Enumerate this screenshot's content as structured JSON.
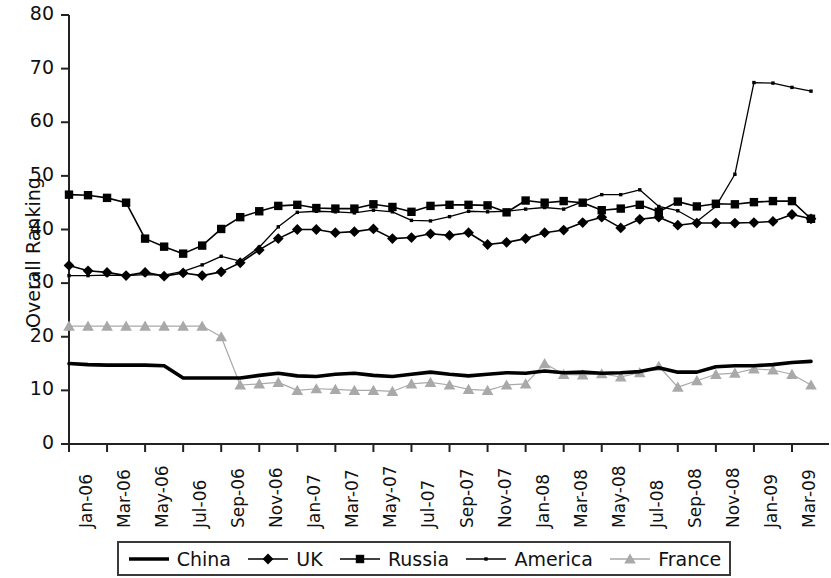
{
  "chart_data": {
    "type": "line",
    "title": "",
    "xlabel": "",
    "ylabel": "Overall Ranking",
    "ylim": [
      0,
      80
    ],
    "ytick_step": 10,
    "yticks": [
      0,
      10,
      20,
      30,
      40,
      50,
      60,
      70,
      80
    ],
    "grid": false,
    "legend_position": "bottom",
    "x": [
      "Jan-06",
      "Feb-06",
      "Mar-06",
      "Apr-06",
      "May-06",
      "Jun-06",
      "Jul-06",
      "Aug-06",
      "Sep-06",
      "Oct-06",
      "Nov-06",
      "Dec-06",
      "Jan-07",
      "Feb-07",
      "Mar-07",
      "Apr-07",
      "May-07",
      "Jun-07",
      "Jul-07",
      "Aug-07",
      "Sep-07",
      "Oct-07",
      "Nov-07",
      "Dec-07",
      "Jan-08",
      "Feb-08",
      "Mar-08",
      "Apr-08",
      "May-08",
      "Jun-08",
      "Jul-08",
      "Aug-08",
      "Sep-08",
      "Oct-08",
      "Nov-08",
      "Dec-08",
      "Jan-09",
      "Feb-09",
      "Mar-09",
      "Apr-09"
    ],
    "xtick_labels": [
      "Jan-06",
      "Mar-06",
      "May-06",
      "Jul-06",
      "Sep-06",
      "Nov-06",
      "Jan-07",
      "Mar-07",
      "May-07",
      "Jul-07",
      "Sep-07",
      "Nov-07",
      "Jan-08",
      "Mar-08",
      "May-08",
      "Jul-08",
      "Sep-08",
      "Nov-08",
      "Jan-09",
      "Mar-09"
    ],
    "xtick_every": 2,
    "series": [
      {
        "name": "China",
        "color": "#000000",
        "marker": "none",
        "line_width": 3.6,
        "values": [
          15.0,
          14.8,
          14.7,
          14.7,
          14.7,
          14.6,
          12.3,
          12.3,
          12.3,
          12.3,
          12.8,
          13.2,
          12.7,
          12.6,
          13.0,
          13.2,
          12.8,
          12.6,
          13.0,
          13.4,
          13.0,
          12.7,
          13.0,
          13.3,
          13.2,
          13.6,
          13.3,
          13.4,
          13.2,
          13.3,
          13.5,
          14.2,
          13.4,
          13.4,
          14.4,
          14.6,
          14.6,
          14.8,
          15.2,
          15.4
        ]
      },
      {
        "name": "UK",
        "color": "#000000",
        "marker": "diamond",
        "line_width": 1.6,
        "values": [
          33.3,
          32.3,
          32.0,
          31.4,
          32.0,
          31.3,
          31.9,
          31.4,
          32.1,
          33.8,
          36.2,
          38.3,
          40.0,
          40.0,
          39.4,
          39.6,
          40.1,
          38.3,
          38.5,
          39.2,
          38.9,
          39.4,
          37.2,
          37.6,
          38.3,
          39.4,
          39.9,
          41.3,
          42.3,
          40.3,
          41.9,
          42.3,
          40.8,
          41.2,
          41.2,
          41.2,
          41.3,
          41.5,
          42.8,
          42.0
        ]
      },
      {
        "name": "Russia",
        "color": "#000000",
        "marker": "square",
        "line_width": 1.6,
        "values": [
          46.5,
          46.4,
          45.9,
          45.0,
          38.3,
          36.8,
          35.5,
          37.0,
          40.1,
          42.3,
          43.4,
          44.4,
          44.6,
          44.0,
          43.9,
          43.9,
          44.7,
          44.2,
          43.3,
          44.4,
          44.6,
          44.6,
          44.5,
          43.2,
          45.4,
          45.0,
          45.3,
          45.0,
          43.6,
          43.9,
          44.6,
          43.3,
          45.2,
          44.3,
          44.8,
          44.7,
          45.1,
          45.3,
          45.3,
          42.0
        ]
      },
      {
        "name": "America",
        "color": "#000000",
        "marker": "dot",
        "line_width": 1.3,
        "values": [
          31.4,
          31.4,
          31.5,
          31.4,
          31.6,
          31.5,
          32.2,
          33.4,
          35.0,
          34.1,
          36.7,
          40.5,
          43.2,
          43.4,
          43.3,
          43.1,
          43.6,
          43.3,
          41.7,
          41.6,
          42.4,
          43.4,
          43.3,
          43.4,
          43.8,
          44.1,
          43.8,
          45.2,
          46.5,
          46.5,
          47.4,
          44.3,
          43.5,
          41.5,
          44.3,
          50.3,
          67.4,
          67.3,
          66.5,
          65.8
        ]
      },
      {
        "name": "France",
        "color": "#a9a9a9",
        "marker": "triangle",
        "line_width": 1.2,
        "values": [
          22.0,
          22.0,
          22.0,
          22.0,
          22.0,
          22.0,
          22.0,
          22.0,
          20.0,
          11.0,
          11.2,
          11.5,
          10.0,
          10.3,
          10.2,
          10.0,
          10.0,
          9.8,
          11.2,
          11.5,
          11.0,
          10.2,
          10.0,
          11.0,
          11.2,
          15.0,
          13.0,
          12.9,
          13.1,
          12.5,
          13.3,
          14.5,
          10.6,
          11.8,
          13.0,
          13.2,
          14.0,
          13.8,
          13.0,
          11.0
        ]
      }
    ]
  },
  "legend": {
    "items": [
      {
        "label": "China",
        "marker": "line"
      },
      {
        "label": "UK",
        "marker": "diamond"
      },
      {
        "label": "Russia",
        "marker": "square"
      },
      {
        "label": "America",
        "marker": "dot"
      },
      {
        "label": "France",
        "marker": "triangle"
      }
    ]
  },
  "axes": {
    "y_title": "Overall Ranking"
  }
}
